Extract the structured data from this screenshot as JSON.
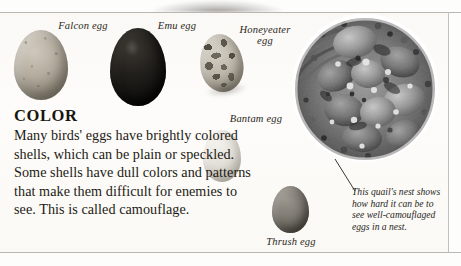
{
  "page": {
    "section_heading": "COLOR",
    "body_text": "Many birds' eggs have brightly colored shells, which can be plain or speckled. Some shells have dull colors and patterns that make them difficult for enemies to see. This is called camouflage."
  },
  "eggs": [
    {
      "id": "falcon",
      "label": "Falcon egg",
      "color": "#b3ac9e",
      "description": "speckled grey-tan egg"
    },
    {
      "id": "emu",
      "label": "Emu egg",
      "color": "#22201c",
      "description": "dark near-black egg"
    },
    {
      "id": "honeyeater",
      "label": "Honeyeater\negg",
      "color": "#bdb7aa",
      "description": "heavily blotched egg"
    },
    {
      "id": "bantam",
      "label": "Bantam egg",
      "color": "#e2dfd7",
      "description": "pale cream egg"
    },
    {
      "id": "thrush",
      "label": "Thrush egg",
      "color": "#7e7a72",
      "description": "medium grey egg"
    }
  ],
  "nest": {
    "caption": "This quail's nest shows how hard it can be to see well-camouflaged eggs in a nest.",
    "alt": "quail-nest-photograph"
  }
}
